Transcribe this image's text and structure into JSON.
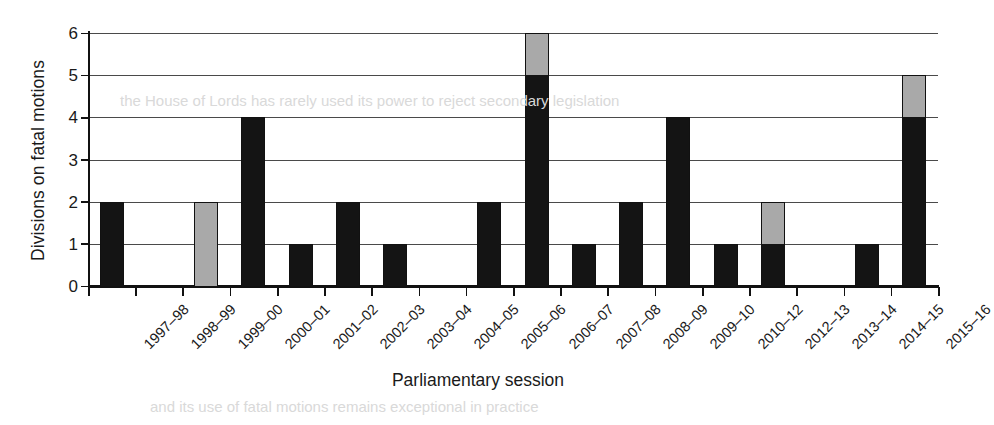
{
  "chart_data": {
    "type": "bar",
    "title": "",
    "xlabel": "Parliamentary session",
    "ylabel": "Divisions on fatal motions",
    "ylim": [
      0,
      6
    ],
    "yticks": [
      0,
      1,
      2,
      3,
      4,
      5,
      6
    ],
    "grid": true,
    "legend": "none",
    "stacked": true,
    "colors": {
      "dark": "#141414",
      "light": "#a9a9a9",
      "axis": "#111111",
      "gridline": "#4a4a4a",
      "background": "#ffffff"
    },
    "categories": [
      "1997–98",
      "1998–99",
      "1999–00",
      "2000–01",
      "2001–02",
      "2002–03",
      "2003–04",
      "2004–05",
      "2005–06",
      "2006–07",
      "2007–08",
      "2008–09",
      "2009–10",
      "2010–12",
      "2012–13",
      "2013–14",
      "2014–15",
      "2015–16"
    ],
    "series": [
      {
        "name": "dark",
        "values": [
          2,
          0,
          0,
          4,
          1,
          2,
          1,
          0,
          2,
          5,
          1,
          2,
          4,
          1,
          1,
          0,
          1,
          4
        ]
      },
      {
        "name": "light",
        "values": [
          0,
          0,
          2,
          0,
          0,
          0,
          0,
          0,
          0,
          1,
          0,
          0,
          0,
          0,
          1,
          0,
          0,
          1
        ]
      }
    ],
    "totals": [
      2,
      0,
      2,
      4,
      1,
      2,
      1,
      0,
      2,
      6,
      1,
      2,
      4,
      1,
      2,
      0,
      1,
      5
    ]
  },
  "bleed_text": {
    "line_a": "the House of Lords has rarely used its power to reject secondary legislation",
    "line_b": "and its use of fatal motions remains exceptional in practice"
  }
}
